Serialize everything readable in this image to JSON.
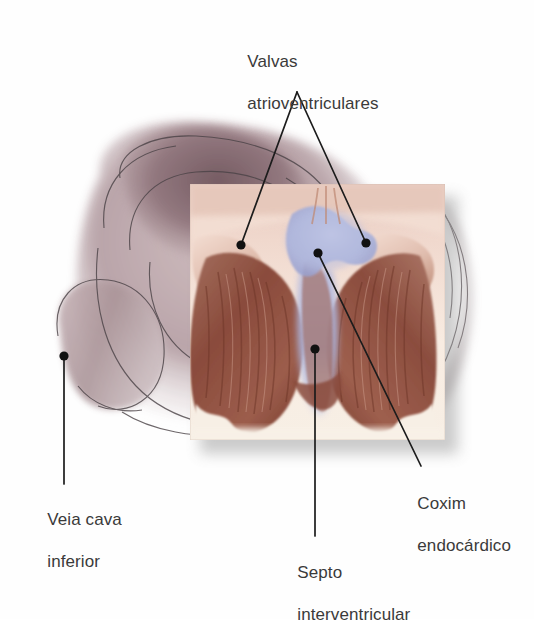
{
  "figure": {
    "language": "pt-BR",
    "background_color": "#ffffff",
    "text_color": "#3a3a3a",
    "labels": [
      {
        "id": "valvas",
        "line1": "Valvas",
        "line2": "atrioventriculares",
        "full_text": "Valvas atrioventriculares",
        "position": "top-center",
        "leader_dots": 2
      },
      {
        "id": "veia-cava",
        "line1": "Veia cava",
        "line2": "inferior",
        "full_text": "Veia cava inferior",
        "position": "bottom-left",
        "leader_dots": 1
      },
      {
        "id": "septo",
        "line1": "Septo",
        "line2": "interventricular",
        "full_text": "Septo interventricular",
        "position": "bottom-center",
        "leader_dots": 1
      },
      {
        "id": "coxim",
        "line1": "Coxim",
        "line2": "endocárdico",
        "full_text": "Coxim endocárdico",
        "position": "bottom-right",
        "leader_dots": 1
      }
    ],
    "illustration": {
      "outer_heart_name": "heart-exterior-silhouette",
      "inset_panel_name": "magnified-ventricle-inset",
      "inset_bounds": {
        "x": 190,
        "y": 184,
        "width": 255,
        "height": 256
      },
      "colors": {
        "myocardium_dark": "#8a4b3c",
        "myocardium_mid": "#a9705e",
        "myocardium_light": "#c89b8b",
        "endocardial_cushion_blue": "#b9bfe0",
        "cushion_blue_deep": "#9aa3d2",
        "exterior_mauve": "#b9a4a8",
        "exterior_mauve_dark": "#8d7277",
        "cream": "#f6ece2",
        "outline": "#4a4246",
        "leader_line": "#1c1c1c",
        "shadow": "#9a9a9a"
      }
    }
  }
}
